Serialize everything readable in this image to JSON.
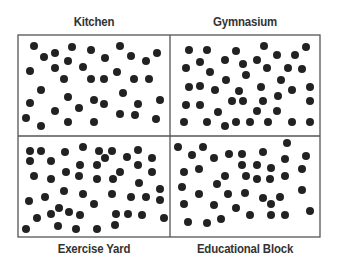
{
  "diagram": {
    "grid": {
      "left": 18,
      "top": 35,
      "right": 320,
      "bottom": 237,
      "mid_x": 170,
      "mid_y": 136
    },
    "colors": {
      "border": "#555555",
      "dot": "#222222",
      "label": "#333333"
    },
    "dot_radius": 4,
    "panels": [
      {
        "id": "kitchen",
        "label": "Kitchen",
        "label_pos": "top",
        "dots": [
          [
            34,
            46
          ],
          [
            44,
            57
          ],
          [
            55,
            53
          ],
          [
            72,
            47
          ],
          [
            91,
            50
          ],
          [
            120,
            46
          ],
          [
            105,
            58
          ],
          [
            68,
            61
          ],
          [
            131,
            56
          ],
          [
            146,
            61
          ],
          [
            157,
            53
          ],
          [
            30,
            71
          ],
          [
            55,
            68
          ],
          [
            83,
            67
          ],
          [
            117,
            72
          ],
          [
            64,
            79
          ],
          [
            91,
            79
          ],
          [
            104,
            79
          ],
          [
            134,
            79
          ],
          [
            149,
            79
          ],
          [
            41,
            90
          ],
          [
            123,
            93
          ],
          [
            68,
            97
          ],
          [
            30,
            103
          ],
          [
            94,
            100
          ],
          [
            104,
            104
          ],
          [
            138,
            104
          ],
          [
            160,
            100
          ],
          [
            55,
            111
          ],
          [
            79,
            108
          ],
          [
            120,
            114
          ],
          [
            135,
            115
          ],
          [
            26,
            118
          ],
          [
            41,
            126
          ],
          [
            68,
            122
          ],
          [
            94,
            122
          ],
          [
            156,
            119
          ]
        ]
      },
      {
        "id": "gymnasium",
        "label": "Gymnasium",
        "label_pos": "top",
        "dots": [
          [
            189,
            50
          ],
          [
            207,
            50
          ],
          [
            236,
            51
          ],
          [
            264,
            46
          ],
          [
            277,
            55
          ],
          [
            295,
            55
          ],
          [
            306,
            47
          ],
          [
            200,
            62
          ],
          [
            225,
            60
          ],
          [
            243,
            64
          ],
          [
            257,
            60
          ],
          [
            186,
            68
          ],
          [
            210,
            72
          ],
          [
            267,
            68
          ],
          [
            288,
            68
          ],
          [
            302,
            69
          ],
          [
            246,
            75
          ],
          [
            226,
            80
          ],
          [
            281,
            80
          ],
          [
            189,
            87
          ],
          [
            200,
            86
          ],
          [
            215,
            90
          ],
          [
            239,
            91
          ],
          [
            261,
            87
          ],
          [
            292,
            90
          ],
          [
            310,
            87
          ],
          [
            232,
            101
          ],
          [
            243,
            101
          ],
          [
            263,
            101
          ],
          [
            278,
            96
          ],
          [
            310,
            101
          ],
          [
            186,
            105
          ],
          [
            200,
            105
          ],
          [
            218,
            112
          ],
          [
            257,
            111
          ],
          [
            277,
            111
          ],
          [
            184,
            122
          ],
          [
            207,
            122
          ],
          [
            225,
            126
          ],
          [
            236,
            122
          ],
          [
            250,
            122
          ],
          [
            268,
            122
          ],
          [
            292,
            122
          ],
          [
            310,
            122
          ]
        ]
      },
      {
        "id": "exercise-yard",
        "label": "Exercise Yard",
        "label_pos": "bottom",
        "dots": [
          [
            30,
            151
          ],
          [
            41,
            151
          ],
          [
            65,
            152
          ],
          [
            83,
            147
          ],
          [
            99,
            151
          ],
          [
            112,
            151
          ],
          [
            138,
            150
          ],
          [
            30,
            161
          ],
          [
            51,
            161
          ],
          [
            105,
            158
          ],
          [
            127,
            157
          ],
          [
            152,
            158
          ],
          [
            80,
            165
          ],
          [
            97,
            165
          ],
          [
            138,
            165
          ],
          [
            34,
            176
          ],
          [
            51,
            179
          ],
          [
            66,
            172
          ],
          [
            79,
            176
          ],
          [
            97,
            179
          ],
          [
            113,
            179
          ],
          [
            120,
            172
          ],
          [
            152,
            172
          ],
          [
            139,
            183
          ],
          [
            64,
            191
          ],
          [
            83,
            194
          ],
          [
            112,
            194
          ],
          [
            160,
            189
          ],
          [
            29,
            201
          ],
          [
            45,
            197
          ],
          [
            131,
            197
          ],
          [
            146,
            197
          ],
          [
            160,
            200
          ],
          [
            59,
            208
          ],
          [
            94,
            204
          ],
          [
            69,
            212
          ],
          [
            51,
            214
          ],
          [
            80,
            215
          ],
          [
            116,
            214
          ],
          [
            128,
            214
          ],
          [
            142,
            215
          ],
          [
            37,
            218
          ],
          [
            164,
            218
          ],
          [
            26,
            229
          ],
          [
            58,
            226
          ],
          [
            76,
            229
          ],
          [
            97,
            229
          ],
          [
            115,
            225
          ]
        ]
      },
      {
        "id": "educational-block",
        "label": "Educational Block",
        "label_pos": "bottom",
        "dots": [
          [
            178,
            147
          ],
          [
            203,
            147
          ],
          [
            287,
            143
          ],
          [
            192,
            155
          ],
          [
            214,
            158
          ],
          [
            229,
            154
          ],
          [
            242,
            154
          ],
          [
            263,
            152
          ],
          [
            285,
            159
          ],
          [
            306,
            156
          ],
          [
            242,
            165
          ],
          [
            257,
            165
          ],
          [
            271,
            168
          ],
          [
            199,
            169
          ],
          [
            184,
            172
          ],
          [
            225,
            176
          ],
          [
            246,
            176
          ],
          [
            257,
            179
          ],
          [
            270,
            179
          ],
          [
            285,
            176
          ],
          [
            302,
            169
          ],
          [
            217,
            184
          ],
          [
            182,
            187
          ],
          [
            199,
            194
          ],
          [
            228,
            194
          ],
          [
            245,
            193
          ],
          [
            263,
            198
          ],
          [
            280,
            197
          ],
          [
            302,
            190
          ],
          [
            184,
            204
          ],
          [
            214,
            205
          ],
          [
            236,
            208
          ],
          [
            271,
            204
          ],
          [
            250,
            215
          ],
          [
            271,
            215
          ],
          [
            285,
            215
          ],
          [
            310,
            211
          ],
          [
            188,
            222
          ],
          [
            207,
            223
          ],
          [
            221,
            219
          ]
        ]
      }
    ]
  }
}
